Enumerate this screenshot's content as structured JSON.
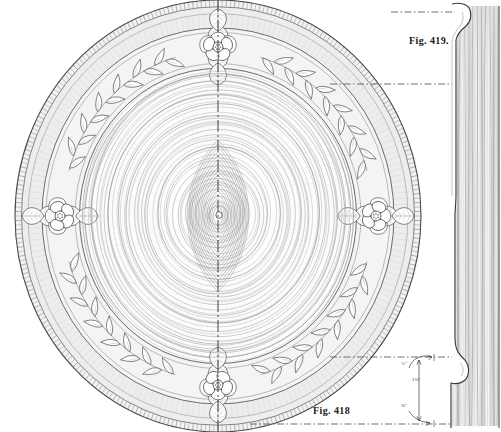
{
  "figure": {
    "plan": {
      "label": "Fig. 418",
      "name": "carved-wooden-plate-plan-view",
      "description": "Plan view of a turned and carved wooden plate with laurel-leaf border and four carved flower rosettes",
      "center_x": 218,
      "center_y": 216,
      "outer_radius_x": 203,
      "outer_radius_y": 216
    },
    "section": {
      "label": "Fig. 419.",
      "name": "plate-edge-section-profile",
      "description": "Vertical cross-section profile of the plate rim showing moulding and end-grain"
    }
  },
  "dimensions": [
    {
      "id": "a",
      "value": "¾″",
      "name": "rim-width-dimension"
    },
    {
      "id": "b",
      "value": "1⅛″",
      "name": "overall-thickness-dimension"
    },
    {
      "id": "c",
      "value": "⅜″",
      "name": "foot-height-dimension"
    }
  ],
  "linework": {
    "ink": "#3a3a3a",
    "ink_light": "#8d8d8d",
    "ink_faint": "#b6b6b6",
    "shade": "#efefef",
    "shade_mid": "#e4e4e4",
    "paper": "#ffffff",
    "centerline": "#4a4a4a"
  },
  "ornament": {
    "rosette_count": 4,
    "rosette_name": "carved-flower-rosette",
    "laurel_band_name": "laurel-leaf-border-band",
    "grain_name": "concentric-wood-grain",
    "reeded_edge_name": "reeded-outer-edge"
  },
  "guides": {
    "vertical_centerline": "dash-dot",
    "projection_lines": [
      {
        "name": "projection-line-top",
        "y": 84
      },
      {
        "name": "projection-line-bottom",
        "y": 357
      },
      {
        "name": "projection-line-base",
        "y": 424
      }
    ]
  }
}
